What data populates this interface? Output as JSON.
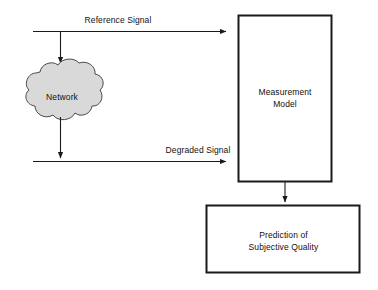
{
  "diagram": {
    "background_color": "#ffffff",
    "stroke_color": "#1a1a1a",
    "cloud_fill_color": "#d9d9d9",
    "box_fill_color": "#ffffff",
    "nodes": [
      {
        "id": "network",
        "shape": "cloud",
        "label": "Network",
        "fill": "#d9d9d9"
      },
      {
        "id": "measurement-model",
        "shape": "rectangle",
        "label": "Measurement\nModel",
        "fill": "#ffffff"
      },
      {
        "id": "prediction",
        "shape": "rectangle",
        "label": "Prediction of\nSubjective Quality",
        "fill": "#ffffff"
      }
    ],
    "edges": [
      {
        "id": "reference-signal",
        "label": "Reference Signal",
        "from": "source",
        "to": "measurement-model"
      },
      {
        "id": "reference-to-network",
        "label": "",
        "from": "reference-signal",
        "to": "network"
      },
      {
        "id": "network-to-degraded",
        "label": "",
        "from": "network",
        "to": "degraded-signal"
      },
      {
        "id": "degraded-signal",
        "label": "Degraded Signal",
        "from": "network",
        "to": "measurement-model"
      },
      {
        "id": "model-to-prediction",
        "label": "",
        "from": "measurement-model",
        "to": "prediction"
      }
    ]
  }
}
